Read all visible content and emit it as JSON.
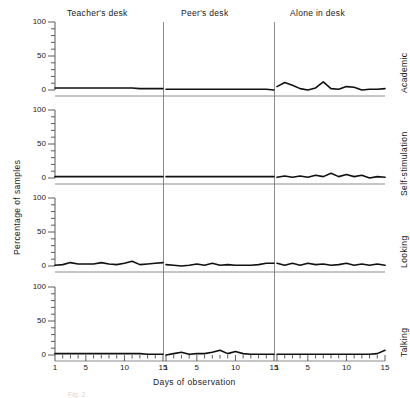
{
  "figure": {
    "caption": "Fig. 2.",
    "ylabel": "Percentage of samples",
    "xlabel": "Days of observation",
    "columns": [
      "Teacher's desk",
      "Peer's desk",
      "Alone in desk"
    ],
    "rows": [
      "Academic",
      "Self-stimulation",
      "Looking",
      "Talking"
    ],
    "ytick_labels": [
      "0",
      "50",
      "100"
    ],
    "xtick_labels": [
      "1",
      "5",
      "10",
      "15"
    ],
    "line_color": "#111111",
    "axis_color": "#4a4a4a"
  },
  "chart_data": {
    "type": "line",
    "title": "",
    "xlabel": "Days of observation",
    "ylabel": "Percentage of samples",
    "xlim": [
      1,
      15
    ],
    "ylim": [
      0,
      100
    ],
    "yticks": [
      0,
      50,
      100
    ],
    "xticks": [
      1,
      5,
      10,
      15
    ],
    "grid": false,
    "legend": "none",
    "layout": "4 rows (behaviour) x 3 columns (setting) small-multiples",
    "row_labels": [
      "Academic",
      "Self-stimulation",
      "Looking",
      "Talking"
    ],
    "column_labels": [
      "Teacher's desk",
      "Peer's desk",
      "Alone in desk"
    ],
    "x": [
      1,
      2,
      3,
      4,
      5,
      6,
      7,
      8,
      9,
      10,
      11,
      12,
      13,
      14,
      15
    ],
    "panels": [
      {
        "row": "Academic",
        "column": "Teacher's desk",
        "values": [
          3,
          3,
          3,
          3,
          3,
          3,
          3,
          3,
          3,
          3,
          3,
          2,
          2,
          2,
          2
        ]
      },
      {
        "row": "Academic",
        "column": "Peer's desk",
        "values": [
          1,
          1,
          1,
          1,
          1,
          1,
          1,
          1,
          1,
          1,
          1,
          1,
          1,
          1,
          0
        ]
      },
      {
        "row": "Academic",
        "column": "Alone in desk",
        "values": [
          5,
          11,
          7,
          2,
          0,
          3,
          12,
          2,
          1,
          5,
          4,
          0,
          1,
          1,
          2
        ]
      },
      {
        "row": "Self-stimulation",
        "column": "Teacher's desk",
        "values": [
          2,
          2,
          2,
          2,
          2,
          2,
          2,
          2,
          2,
          2,
          2,
          2,
          2,
          2,
          2
        ]
      },
      {
        "row": "Self-stimulation",
        "column": "Peer's desk",
        "values": [
          2,
          2,
          2,
          2,
          2,
          2,
          2,
          2,
          2,
          2,
          2,
          2,
          2,
          2,
          2
        ]
      },
      {
        "row": "Self-stimulation",
        "column": "Alone in desk",
        "values": [
          1,
          3,
          1,
          3,
          1,
          4,
          2,
          7,
          2,
          5,
          2,
          4,
          0,
          2,
          1
        ]
      },
      {
        "row": "Looking",
        "column": "Teacher's desk",
        "values": [
          1,
          2,
          5,
          3,
          3,
          3,
          5,
          3,
          2,
          4,
          7,
          2,
          3,
          4,
          5
        ]
      },
      {
        "row": "Looking",
        "column": "Peer's desk",
        "values": [
          2,
          1,
          0,
          1,
          3,
          1,
          4,
          1,
          2,
          1,
          1,
          1,
          2,
          4,
          4
        ]
      },
      {
        "row": "Looking",
        "column": "Alone in desk",
        "values": [
          4,
          1,
          4,
          1,
          4,
          2,
          3,
          1,
          2,
          4,
          1,
          3,
          1,
          3,
          1
        ]
      },
      {
        "row": "Talking",
        "column": "Teacher's desk",
        "values": [
          2,
          2,
          2,
          2,
          2,
          2,
          2,
          2,
          2,
          2,
          2,
          2,
          1,
          1,
          1
        ]
      },
      {
        "row": "Talking",
        "column": "Peer's desk",
        "values": [
          0,
          2,
          4,
          1,
          2,
          2,
          4,
          7,
          2,
          5,
          2,
          1,
          1,
          1,
          1
        ]
      },
      {
        "row": "Talking",
        "column": "Alone in desk",
        "values": [
          1,
          1,
          1,
          1,
          1,
          1,
          1,
          1,
          1,
          1,
          1,
          1,
          1,
          2,
          7
        ]
      }
    ]
  }
}
